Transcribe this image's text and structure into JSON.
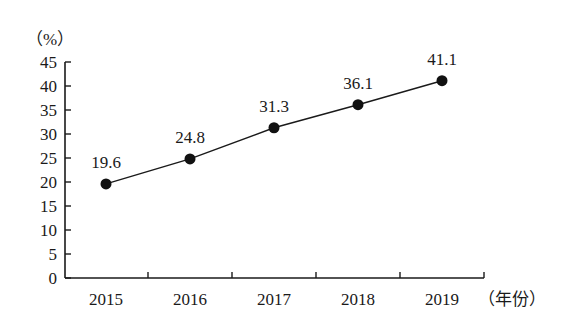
{
  "chart_data": {
    "type": "line",
    "title": "",
    "xlabel": "（年份）",
    "ylabel": "（%）",
    "categories": [
      "2015",
      "2016",
      "2017",
      "2018",
      "2019"
    ],
    "series": [
      {
        "name": "",
        "values": [
          19.6,
          24.8,
          31.3,
          36.1,
          41.1
        ]
      }
    ],
    "data_labels": [
      "19.6",
      "24.8",
      "31.3",
      "36.1",
      "41.1"
    ],
    "yticks": [
      "0",
      "5",
      "10",
      "15",
      "20",
      "25",
      "30",
      "35",
      "40",
      "45"
    ],
    "ylim": [
      0,
      45
    ],
    "grid": false,
    "legend": "none",
    "marker": "filled-circle"
  }
}
